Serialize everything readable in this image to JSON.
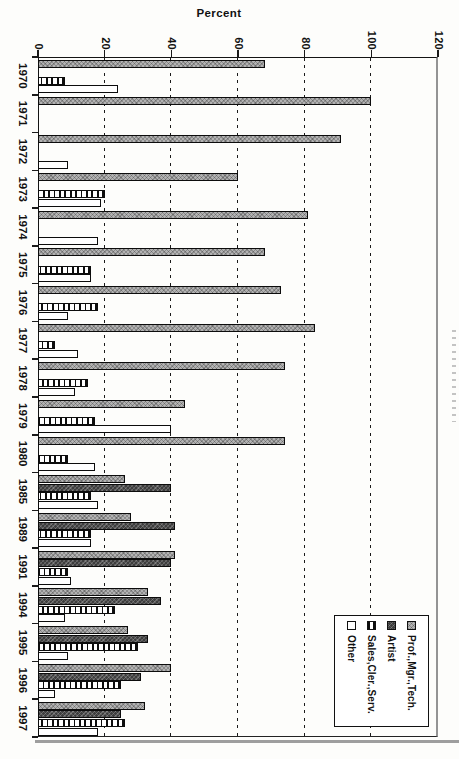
{
  "page": {
    "background": "#fdfdfb"
  },
  "chart_data": {
    "type": "bar",
    "orientation": "columns in landscape; whole chart rotated 90deg clockwise so bars read left-to-right",
    "title": "",
    "ylabel": "Percent",
    "xlabel": "",
    "ylim": [
      0,
      120
    ],
    "yticks": [
      0,
      20,
      40,
      60,
      80,
      100,
      120
    ],
    "grid_values": [
      20,
      40,
      60,
      80,
      100
    ],
    "grid_style": "dashed",
    "legend_position": "top-right inside plot (rotated view: lower right)",
    "categories": [
      "1970",
      "1971",
      "1972",
      "1973",
      "1974",
      "1975",
      "1976",
      "1977",
      "1978",
      "1979",
      "1980",
      "1985",
      "1989",
      "1991",
      "1994",
      "1995",
      "1996",
      "1997"
    ],
    "series": [
      {
        "key": "prof_mgr_tech",
        "name": "Prof.,Mgr.,Tech.",
        "pattern": "gray-crosshatch",
        "color": "#b2b2b2",
        "values": [
          68,
          100,
          91,
          60,
          81,
          68,
          73,
          83,
          74,
          44,
          74,
          26,
          28,
          41,
          33,
          27,
          40,
          32
        ]
      },
      {
        "key": "artist",
        "name": "Artist",
        "pattern": "dark-crosshatch",
        "color": "#3d3d3d",
        "values": [
          0,
          0,
          0,
          0,
          0,
          0,
          0,
          0,
          0,
          0,
          0,
          40,
          41,
          40,
          37,
          33,
          31,
          25
        ]
      },
      {
        "key": "sales_cler_serv",
        "name": "Sales,Cler.,Serv.",
        "pattern": "vertical-stripes",
        "color": "#ffffff",
        "values": [
          8,
          0,
          0,
          20,
          0,
          16,
          18,
          5,
          15,
          17,
          9,
          16,
          16,
          9,
          23,
          30,
          25,
          26
        ]
      },
      {
        "key": "other",
        "name": "Other",
        "pattern": "plain-white",
        "color": "#ffffff",
        "values": [
          24,
          0,
          9,
          19,
          18,
          16,
          9,
          12,
          11,
          40,
          17,
          18,
          16,
          10,
          8,
          9,
          5,
          18
        ]
      }
    ],
    "legend_entries": [
      "Prof.,Mgr.,Tech.",
      "Artist",
      "Sales,Cler.,Serv.",
      "Other"
    ]
  }
}
